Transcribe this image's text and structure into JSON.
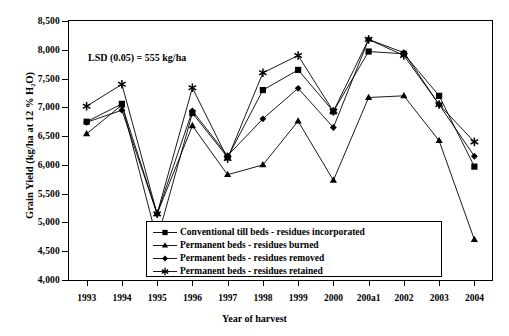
{
  "chart_data": {
    "type": "line",
    "title": "",
    "xlabel": "Year of harvest",
    "ylabel": "Grain Yield (kg/ha at 12 % H₂O)",
    "categories": [
      "1993",
      "1994",
      "1995",
      "1996",
      "1997",
      "1998",
      "1999",
      "2000",
      "200a1",
      "2002",
      "2003",
      "2004"
    ],
    "ylim": [
      4000,
      8500
    ],
    "ytick_labels": [
      "4,000",
      "4,500",
      "5,000",
      "5,500",
      "6,000",
      "6,500",
      "7,000",
      "7,500",
      "8,000",
      "8,500"
    ],
    "ytick_values": [
      4000,
      4500,
      5000,
      5500,
      6000,
      6500,
      7000,
      7500,
      8000,
      8500
    ],
    "grid": false,
    "legend_position": "inside-bottom-center",
    "annotations": [
      {
        "text": "LSD (0.05) = 555 kg/ha",
        "x": "1995",
        "y": 7680
      }
    ],
    "series": [
      {
        "name": "Conventional till beds - residues incorporated",
        "marker": "square",
        "values": [
          6750,
          7060,
          4700,
          6900,
          6130,
          7300,
          7650,
          6930,
          7970,
          7930,
          7200,
          5970
        ]
      },
      {
        "name": "Permanent beds - residues burned",
        "marker": "triangle",
        "values": [
          6540,
          7040,
          5150,
          6680,
          5830,
          6000,
          6760,
          5730,
          7170,
          7200,
          6420,
          4700
        ]
      },
      {
        "name": "Permanent beds - residues removed",
        "marker": "diamond",
        "values": [
          6740,
          6950,
          5150,
          6940,
          6160,
          6800,
          7330,
          6650,
          8180,
          7950,
          7050,
          6150
        ]
      },
      {
        "name": "Permanent beds - residues retained",
        "marker": "asterisk",
        "values": [
          7020,
          7400,
          5150,
          7340,
          6110,
          7600,
          7900,
          6930,
          8180,
          7900,
          7050,
          6400
        ]
      }
    ]
  },
  "legend": {
    "items": [
      "Conventional till beds - residues incorporated",
      "Permanent beds - residues burned",
      "Permanent beds - residues removed",
      "Permanent beds - residues retained"
    ]
  },
  "colors": {
    "line": "#000000",
    "marker": "#000000",
    "background": "#ffffff"
  }
}
